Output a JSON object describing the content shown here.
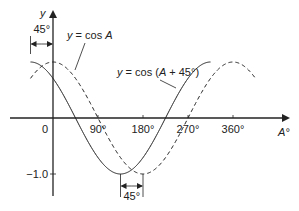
{
  "chart_data": {
    "type": "line",
    "title": "",
    "xlabel": "A°",
    "ylabel": "y",
    "xlim": [
      -45,
      405
    ],
    "ylim": [
      -1.0,
      1.0
    ],
    "x_ticks": [
      {
        "value": 0,
        "label": "0"
      },
      {
        "value": 90,
        "label": "90°"
      },
      {
        "value": 180,
        "label": "180°"
      },
      {
        "value": 270,
        "label": "270°"
      },
      {
        "value": 360,
        "label": "360°"
      }
    ],
    "y_ticks": [
      {
        "value": -1.0,
        "label": "−1.0"
      }
    ],
    "series": [
      {
        "name": "y = cos A",
        "style": "dashed",
        "function": "cos(A)",
        "x_range": [
          -45,
          405
        ]
      },
      {
        "name": "y = cos (A + 45°)",
        "style": "solid",
        "function": "cos(A + 45)",
        "x_range": [
          -45,
          315
        ]
      }
    ],
    "annotations": [
      {
        "text": "45°",
        "meaning": "phase shift at peak, between x = -45 and x = 0",
        "position": "top-left"
      },
      {
        "text": "45°",
        "meaning": "phase shift at trough, between x = 135 and x = 180",
        "position": "bottom"
      },
      {
        "label_a": {
          "prefix": "y = cos ",
          "var": "A"
        },
        "label_b": {
          "prefix": "y = cos (",
          "var": "A",
          "suffix": " + 45°)"
        }
      }
    ],
    "grid": false,
    "legend": "none"
  }
}
